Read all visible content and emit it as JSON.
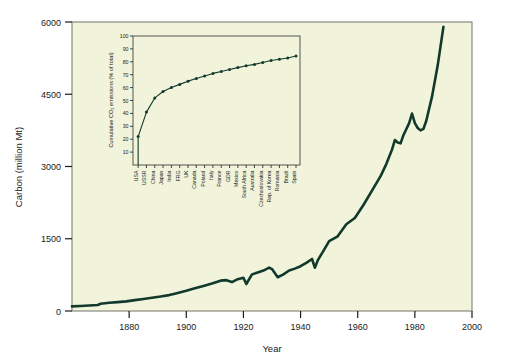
{
  "figure": {
    "background": "#ffffff",
    "plot_background": "#f1f4da",
    "line_color": "#11392c",
    "frame_color": "#8a8a80"
  },
  "chart_data": [
    {
      "id": "main",
      "type": "line",
      "title": "",
      "xlabel": "Year",
      "ylabel": "Carbon (million Mt)",
      "xlim": [
        1860,
        2000
      ],
      "ylim": [
        0,
        6000
      ],
      "xticks": [
        1880,
        1900,
        1920,
        1940,
        1960,
        1980,
        2000
      ],
      "xtick_labels": [
        "1880",
        "1900",
        "1920",
        "1940",
        "1960",
        "1980",
        "2000"
      ],
      "yticks": [
        0,
        1500,
        3000,
        4500,
        6000
      ],
      "ytick_labels": [
        "0",
        "1500",
        "3000",
        "4500",
        "6000"
      ],
      "grid": false,
      "legend": "none",
      "series": [
        {
          "name": "Global carbon emissions",
          "x": [
            1860,
            1863,
            1866,
            1869,
            1870,
            1873,
            1876,
            1879,
            1882,
            1885,
            1888,
            1891,
            1894,
            1896,
            1898,
            1900,
            1903,
            1906,
            1909,
            1912,
            1914,
            1916,
            1918,
            1920,
            1921,
            1923,
            1925,
            1927,
            1929,
            1930,
            1932,
            1934,
            1936,
            1938,
            1940,
            1942,
            1944,
            1945,
            1946,
            1948,
            1950,
            1953,
            1956,
            1959,
            1962,
            1965,
            1968,
            1970,
            1972,
            1973,
            1974,
            1975,
            1976,
            1978,
            1979,
            1980,
            1981,
            1982,
            1983,
            1984,
            1986,
            1988,
            1990
          ],
          "y": [
            95,
            105,
            115,
            125,
            150,
            170,
            185,
            200,
            225,
            250,
            275,
            300,
            330,
            360,
            390,
            420,
            470,
            520,
            570,
            630,
            640,
            600,
            660,
            690,
            560,
            760,
            800,
            840,
            900,
            870,
            700,
            760,
            840,
            880,
            930,
            1000,
            1080,
            900,
            1050,
            1250,
            1450,
            1550,
            1800,
            1930,
            2200,
            2500,
            2800,
            3050,
            3350,
            3550,
            3500,
            3480,
            3650,
            3900,
            4100,
            3900,
            3800,
            3750,
            3780,
            3950,
            4450,
            5100,
            5900
          ]
        }
      ]
    },
    {
      "id": "inset",
      "type": "line",
      "title": "",
      "xlabel": "",
      "ylabel": "Cumulative CO2 emissions (% of total)",
      "ylabel_display": "Cumulative CO₂ emissions (% of total)",
      "ylim": [
        0,
        100
      ],
      "yticks": [
        10,
        20,
        30,
        40,
        50,
        60,
        70,
        80,
        90,
        100
      ],
      "ytick_labels": [
        "10",
        "20",
        "30",
        "40",
        "50",
        "60",
        "70",
        "80",
        "90",
        "100"
      ],
      "grid": false,
      "legend": "none",
      "marker": "filled-circle",
      "categories": [
        "USA",
        "USSR",
        "China",
        "Japan",
        "India",
        "FRG",
        "UK",
        "Canada",
        "Poland",
        "Italy",
        "France",
        "GDR",
        "Mexico",
        "South Africa",
        "Australia",
        "Czechoslovakia",
        "Rep. of Korea",
        "Romania",
        "Brazil",
        "Spain"
      ],
      "values": [
        22,
        41,
        52,
        57,
        60,
        62.5,
        65,
        67,
        69,
        71,
        72.5,
        74,
        75.5,
        77,
        78,
        79.5,
        81,
        82,
        83,
        84.5
      ]
    }
  ]
}
